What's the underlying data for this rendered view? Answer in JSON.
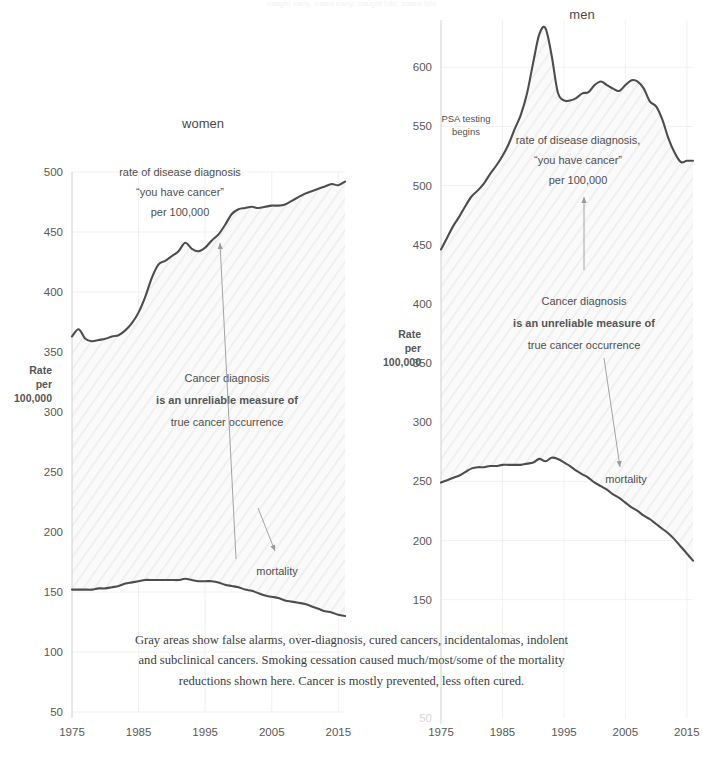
{
  "top_title": "caught early, cured early; caught late, cured late",
  "caption": {
    "line1": "Gray areas show false alarms, over-diagnosis, cured cancers, incidentalomas, indolent",
    "line2": "and subclinical cancers. Smoking cessation caused much/most/some of the mortality",
    "line3": "reductions shown here. Cancer is mostly prevented, less often cured."
  },
  "colors": {
    "line": "#4d4d4d",
    "grid": "#ededed",
    "axis": "#d0d0d0",
    "text": "#4a4a4a",
    "arrow": "#9a9a9a",
    "band_fill": "#f4f4f4"
  },
  "chart_data": [
    {
      "type": "area",
      "id": "women",
      "title": "women",
      "xlabel": "",
      "ylabel": "Rate per 100,000",
      "ylabel_lines": [
        "Rate",
        "per",
        "100,000"
      ],
      "xlim": [
        1975,
        2016
      ],
      "ylim": [
        50,
        500
      ],
      "yticks": [
        50,
        100,
        150,
        200,
        250,
        300,
        350,
        400,
        450,
        500
      ],
      "xticks": [
        1975,
        1985,
        1995,
        2005,
        2015
      ],
      "grid": true,
      "legend": "none",
      "annotations": [
        {
          "name": "incidence-label",
          "lines": [
            "rate of disease diagnosis",
            "“you have cancer”",
            "per 100,000"
          ]
        },
        {
          "name": "gray-area-label",
          "lines": [
            "Cancer diagnosis",
            "is an unreliable measure of",
            "true cancer occurrence"
          ],
          "bold_line": 1
        },
        {
          "name": "mortality-label",
          "lines": [
            "mortality"
          ]
        }
      ],
      "x": [
        1975,
        1976,
        1977,
        1978,
        1979,
        1980,
        1981,
        1982,
        1983,
        1984,
        1985,
        1986,
        1987,
        1988,
        1989,
        1990,
        1991,
        1992,
        1993,
        1994,
        1995,
        1996,
        1997,
        1998,
        1999,
        2000,
        2001,
        2002,
        2003,
        2004,
        2005,
        2006,
        2007,
        2008,
        2009,
        2010,
        2011,
        2012,
        2013,
        2014,
        2015,
        2016
      ],
      "series": [
        {
          "name": "rate of disease diagnosis",
          "values": [
            363,
            369,
            361,
            359,
            360,
            361,
            363,
            364,
            368,
            374,
            383,
            396,
            412,
            423,
            426,
            430,
            434,
            441,
            436,
            434,
            437,
            443,
            448,
            456,
            465,
            469,
            470,
            471,
            470,
            471,
            472,
            472,
            473,
            476,
            479,
            482,
            484,
            486,
            488,
            490,
            489,
            492
          ]
        },
        {
          "name": "mortality",
          "values": [
            152,
            152,
            152,
            152,
            153,
            153,
            154,
            155,
            157,
            158,
            159,
            160,
            160,
            160,
            160,
            160,
            160,
            161,
            160,
            159,
            159,
            159,
            158,
            156,
            155,
            154,
            152,
            151,
            149,
            147,
            146,
            145,
            143,
            142,
            141,
            140,
            138,
            136,
            134,
            133,
            131,
            130
          ]
        }
      ]
    },
    {
      "type": "area",
      "id": "men",
      "title": "men",
      "xlabel": "",
      "ylabel": "Rate per 100,000",
      "ylabel_lines": [
        "Rate",
        "per",
        "100,000"
      ],
      "xlim": [
        1975,
        2016
      ],
      "ylim": [
        50,
        640
      ],
      "yticks": [
        150,
        200,
        250,
        300,
        350,
        400,
        450,
        500,
        550,
        600
      ],
      "faint_yticks": [
        50
      ],
      "xticks": [
        1975,
        1985,
        1995,
        2005,
        2015
      ],
      "grid": true,
      "legend": "none",
      "annotations": [
        {
          "name": "psa-label",
          "lines": [
            "PSA testing",
            "begins"
          ]
        },
        {
          "name": "incidence-label",
          "lines": [
            "rate of disease diagnosis,",
            "“you have cancer”",
            "per 100,000"
          ]
        },
        {
          "name": "gray-area-label",
          "lines": [
            "Cancer diagnosis",
            "is an unreliable measure of",
            "true cancer occurrence"
          ],
          "bold_line": 1
        },
        {
          "name": "mortality-label",
          "lines": [
            "mortality"
          ]
        }
      ],
      "x": [
        1975,
        1976,
        1977,
        1978,
        1979,
        1980,
        1981,
        1982,
        1983,
        1984,
        1985,
        1986,
        1987,
        1988,
        1989,
        1990,
        1991,
        1992,
        1993,
        1994,
        1995,
        1996,
        1997,
        1998,
        1999,
        2000,
        2001,
        2002,
        2003,
        2004,
        2005,
        2006,
        2007,
        2008,
        2009,
        2010,
        2011,
        2012,
        2013,
        2014,
        2015,
        2016
      ],
      "series": [
        {
          "name": "rate of disease diagnosis",
          "values": [
            446,
            456,
            466,
            474,
            483,
            491,
            496,
            502,
            510,
            517,
            525,
            535,
            548,
            560,
            578,
            604,
            628,
            633,
            610,
            579,
            572,
            572,
            574,
            578,
            579,
            585,
            588,
            585,
            582,
            580,
            585,
            589,
            588,
            582,
            571,
            567,
            556,
            540,
            528,
            520,
            521,
            521
          ]
        },
        {
          "name": "mortality",
          "values": [
            249,
            251,
            253,
            255,
            258,
            261,
            262,
            262,
            263,
            263,
            264,
            264,
            264,
            264,
            265,
            266,
            269,
            267,
            270,
            269,
            266,
            263,
            259,
            256,
            253,
            249,
            246,
            243,
            239,
            236,
            232,
            228,
            225,
            221,
            218,
            214,
            210,
            206,
            201,
            195,
            189,
            183
          ]
        }
      ]
    }
  ]
}
